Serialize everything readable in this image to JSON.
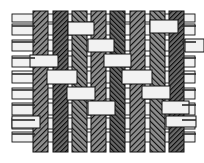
{
  "figure": {
    "width": 204,
    "height": 163,
    "background_color": "#ffffff"
  },
  "colors": {
    "background": "#ffffff",
    "warp_fill_dark": "#5a5a5a",
    "warp_fill_mid": "#7d7d7d",
    "warp_fill_light": "#9a9a9a",
    "warp_hatch_line": "#1a1a1a",
    "weft_fill": "#f2f2f2",
    "outline": "#111111",
    "thread_stub": "#2a2a2a"
  },
  "warp": {
    "label": "warp-threads-vertical",
    "count": 8,
    "top_y": 11,
    "bottom_y": 152,
    "threads": [
      {
        "id": "warp-1",
        "x": 33,
        "width": 15,
        "shade": "#6e6e6e",
        "hatch": "left"
      },
      {
        "id": "warp-2",
        "x": 53,
        "width": 15,
        "shade": "#5a5a5a",
        "hatch": "left"
      },
      {
        "id": "warp-3",
        "x": 72,
        "width": 15,
        "shade": "#8a8a8a",
        "hatch": "right"
      },
      {
        "id": "warp-4",
        "x": 91,
        "width": 15,
        "shade": "#6a6a6a",
        "hatch": "left"
      },
      {
        "id": "warp-5",
        "x": 110,
        "width": 15,
        "shade": "#7a7a7a",
        "hatch": "right"
      },
      {
        "id": "warp-6",
        "x": 130,
        "width": 15,
        "shade": "#6e6e6e",
        "hatch": "left"
      },
      {
        "id": "warp-7",
        "x": 150,
        "width": 15,
        "shade": "#808080",
        "hatch": "right"
      },
      {
        "id": "warp-8",
        "x": 169,
        "width": 15,
        "shade": "#6a6a6a",
        "hatch": "left"
      }
    ]
  },
  "weft": {
    "label": "weft-threads-horizontal",
    "count": 9,
    "left_x": 12,
    "right_x": 195,
    "threads": [
      {
        "id": "weft-1",
        "y": 24,
        "height": 11
      },
      {
        "id": "weft-2",
        "y": 40,
        "height": 11
      },
      {
        "id": "weft-3",
        "y": 56,
        "height": 11
      },
      {
        "id": "weft-4",
        "y": 71,
        "height": 12
      },
      {
        "id": "weft-5",
        "y": 88,
        "height": 11
      },
      {
        "id": "weft-6",
        "y": 103,
        "height": 12
      },
      {
        "id": "weft-7",
        "y": 118,
        "height": 11
      },
      {
        "id": "weft-8",
        "y": 132,
        "height": 10
      },
      {
        "id": "weft-9",
        "y": 14,
        "height": 8
      }
    ]
  },
  "weave_pattern": {
    "type": "plain-weave",
    "note": "alternating over-under interlacing; weft segments shown light where passing over warp",
    "rows": [
      [
        0,
        1,
        0,
        1,
        0,
        1,
        0,
        1
      ],
      [
        1,
        0,
        1,
        0,
        1,
        0,
        1,
        0
      ],
      [
        0,
        1,
        0,
        1,
        0,
        1,
        0,
        1
      ],
      [
        1,
        0,
        1,
        0,
        1,
        0,
        1,
        0
      ],
      [
        0,
        1,
        0,
        1,
        0,
        1,
        0,
        1
      ],
      [
        1,
        0,
        1,
        0,
        1,
        0,
        1,
        0
      ],
      [
        0,
        1,
        0,
        1,
        0,
        1,
        0,
        1
      ],
      [
        1,
        0,
        1,
        0,
        1,
        0,
        1,
        0
      ]
    ]
  },
  "weft_over_segments": [
    {
      "row": 0,
      "x": 68,
      "y": 22,
      "w": 26,
      "h": 13
    },
    {
      "row": 0,
      "x": 150,
      "y": 20,
      "w": 28,
      "h": 13
    },
    {
      "row": 1,
      "x": 88,
      "y": 39,
      "w": 26,
      "h": 13
    },
    {
      "row": 1,
      "x": 185,
      "y": 39,
      "w": 19,
      "h": 13
    },
    {
      "row": 2,
      "x": 30,
      "y": 55,
      "w": 28,
      "h": 12
    },
    {
      "row": 2,
      "x": 104,
      "y": 54,
      "w": 27,
      "h": 13
    },
    {
      "row": 3,
      "x": 47,
      "y": 70,
      "w": 30,
      "h": 14
    },
    {
      "row": 3,
      "x": 122,
      "y": 70,
      "w": 30,
      "h": 14
    },
    {
      "row": 4,
      "x": 67,
      "y": 87,
      "w": 28,
      "h": 13
    },
    {
      "row": 4,
      "x": 142,
      "y": 86,
      "w": 28,
      "h": 13
    },
    {
      "row": 5,
      "x": 88,
      "y": 101,
      "w": 27,
      "h": 14
    },
    {
      "row": 5,
      "x": 162,
      "y": 101,
      "w": 27,
      "h": 13
    },
    {
      "row": 6,
      "x": 12,
      "y": 116,
      "w": 28,
      "h": 12
    },
    {
      "row": 6,
      "x": 166,
      "y": 116,
      "w": 30,
      "h": 11
    }
  ],
  "edge_stubs": {
    "left": {
      "label": "weft-ends-left",
      "x_start": 12,
      "count": 8,
      "ys": [
        26,
        42,
        58,
        74,
        90,
        105,
        120,
        134
      ]
    },
    "right": {
      "label": "weft-ends-right",
      "x_end": 196,
      "count": 8,
      "ys": [
        26,
        42,
        58,
        74,
        90,
        105,
        120,
        134
      ]
    }
  },
  "legend": {
    "warp_label": "warp (hatched)",
    "weft_label": "weft (plain)"
  }
}
